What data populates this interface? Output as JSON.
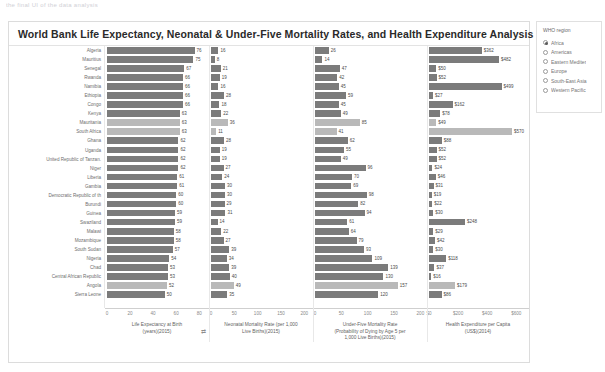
{
  "topstrip": "the final UI of the data analysis",
  "dashboard": {
    "title": "World Bank Life Expectancy, Neonatal & Under-Five Mortality Rates, and Health Expenditure Analysis"
  },
  "filter": {
    "title": "WHO region",
    "options": [
      {
        "label": "Africa",
        "selected": true
      },
      {
        "label": "Americas",
        "selected": false
      },
      {
        "label": "Eastern Mediter",
        "selected": false
      },
      {
        "label": "Europe",
        "selected": false
      },
      {
        "label": "South-East Asia",
        "selected": false
      },
      {
        "label": "Western Pacific",
        "selected": false
      }
    ]
  },
  "chart_data": {
    "type": "bar",
    "title": "World Bank Life Expectancy, Neonatal & Under-Five Mortality Rates, and Health Expenditure Analysis",
    "orientation": "horizontal",
    "grid": false,
    "legend": "none",
    "categories": [
      "Algeria",
      "Mauritius",
      "Senegal",
      "Rwanda",
      "Namibia",
      "Ethiopia",
      "Congo",
      "Kenya",
      "Mauritania",
      "South Africa",
      "Ghana",
      "Uganda",
      "United Republic of Tanzan.",
      "Niger",
      "Liberia",
      "Gambia",
      "Democratic Republic of th",
      "Burundi",
      "Guinea",
      "Swaziland",
      "Malawi",
      "Mozambique",
      "South Sudan",
      "Nigeria",
      "Chad",
      "Central African Republic",
      "Angola",
      "Sierra Leone"
    ],
    "highlighted": [
      "Mauritania",
      "South Africa",
      "Angola"
    ],
    "panels": [
      {
        "key": "life_expectancy",
        "xlabel": "Life Expectancy at Birth (years)(2015)",
        "xlabel_line1": "Life Expectancy at Birth",
        "xlabel_line2": "(years)(2015)",
        "ticks": [
          "0",
          "20",
          "40",
          "60",
          "80"
        ],
        "tick_values": [
          0,
          20,
          40,
          60,
          80
        ],
        "xlim": [
          0,
          85
        ],
        "prefix": "",
        "values": [
          76,
          75,
          67,
          66,
          66,
          66,
          66,
          63,
          63,
          63,
          62,
          62,
          62,
          62,
          61,
          61,
          60,
          60,
          59,
          59,
          58,
          58,
          57,
          54,
          53,
          53,
          52,
          50
        ]
      },
      {
        "key": "neonatal_mortality",
        "xlabel": "Neonatal Mortality Rate (per 1,000 Live Births)(2015)",
        "xlabel_line1": "Neonatal Mortality Rate (per 1,000",
        "xlabel_line2": "Live Births)(2015)",
        "ticks": [
          "0",
          "50",
          "100",
          "150",
          "200"
        ],
        "tick_values": [
          0,
          50,
          100,
          150,
          200
        ],
        "xlim": [
          0,
          210
        ],
        "prefix": "",
        "values": [
          16,
          8,
          21,
          19,
          16,
          28,
          18,
          22,
          36,
          11,
          28,
          19,
          19,
          27,
          24,
          30,
          30,
          29,
          31,
          14,
          22,
          27,
          39,
          34,
          39,
          40,
          49,
          35
        ]
      },
      {
        "key": "under_five_mortality",
        "xlabel": "Under-Five Mortality Rate (Probability of Dying by Age 5 per 1,000 Live Births)(2015)",
        "xlabel_line1": "Under-Five Mortality Rate",
        "xlabel_line2": "(Probability of Dying by Age 5 per",
        "xlabel_line3": "1,000 Live Births)(2015)",
        "ticks": [
          "0",
          "50",
          "100",
          "150",
          "200"
        ],
        "tick_values": [
          0,
          50,
          100,
          150,
          200
        ],
        "xlim": [
          0,
          205
        ],
        "prefix": "",
        "values": [
          26,
          14,
          47,
          42,
          45,
          59,
          45,
          49,
          85,
          41,
          62,
          55,
          49,
          96,
          70,
          69,
          98,
          82,
          94,
          61,
          64,
          79,
          93,
          109,
          139,
          130,
          157,
          120
        ]
      },
      {
        "key": "health_expenditure",
        "xlabel": "Health Expenditure per Capita (US$)(2014)",
        "xlabel_line1": "Health Expenditure per Capita",
        "xlabel_line2": "(US$)(2014)",
        "ticks": [
          "$0",
          "$200",
          "$400",
          "$600"
        ],
        "tick_values": [
          0,
          200,
          400,
          600
        ],
        "xlim": [
          0,
          660
        ],
        "prefix": "$",
        "values": [
          362,
          482,
          50,
          52,
          499,
          27,
          162,
          78,
          49,
          570,
          88,
          52,
          52,
          24,
          46,
          31,
          19,
          22,
          30,
          248,
          29,
          42,
          30,
          118,
          37,
          16,
          179,
          86
        ]
      }
    ]
  }
}
